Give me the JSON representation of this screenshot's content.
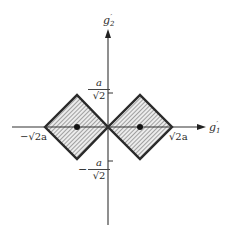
{
  "diagram": {
    "type": "coordinate-plot",
    "axes": {
      "x_label": {
        "base": "g",
        "prime": "′",
        "sub": "1"
      },
      "y_label": {
        "base": "g",
        "prime": "′",
        "sub": "2"
      }
    },
    "tick_labels": {
      "y_pos": {
        "num": "a",
        "den": "√2",
        "sign": ""
      },
      "y_neg": {
        "num": "a",
        "den": "√2",
        "sign": "−"
      },
      "x_neg": "−√2a",
      "x_pos": "√2a"
    },
    "regions": [
      {
        "name": "left-square",
        "center": "−a/√2",
        "fill": "hatched"
      },
      {
        "name": "right-square",
        "center": "a/√2",
        "fill": "hatched"
      }
    ],
    "colors": {
      "stroke": "#2a2a2a",
      "hatch": "#555555",
      "fill_bg": "#e8e8e8",
      "background": "#ffffff"
    }
  }
}
